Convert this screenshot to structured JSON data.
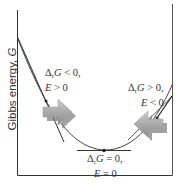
{
  "diagram": {
    "y_axis_label": "Gibbs energy, ",
    "y_axis_symbol": "G",
    "labels": {
      "left": {
        "line1_delta": "Δ",
        "line1_sub": "r",
        "line1_sym": "G",
        "line1_rest": " < 0,",
        "line2_sym": "E",
        "line2_rest": " > 0"
      },
      "right": {
        "line1_delta": "Δ",
        "line1_sub": "r",
        "line1_sym": "G",
        "line1_rest": " > 0,",
        "line2_sym": "E",
        "line2_rest": " < 0"
      },
      "bottom": {
        "line1_delta": "Δ",
        "line1_sub": "r",
        "line1_sym": "G",
        "line1_rest": " = 0,",
        "line2_sym": "E",
        "line2_rest": " = 0"
      }
    },
    "arrows": [
      {
        "position": "left",
        "direction": "right"
      },
      {
        "position": "right",
        "direction": "left"
      }
    ],
    "colors": {
      "axis": "#333333",
      "curve": "#444444",
      "arrow_fill": "#a8a8a8",
      "arrow_shadow": "#7a7a7a"
    }
  }
}
